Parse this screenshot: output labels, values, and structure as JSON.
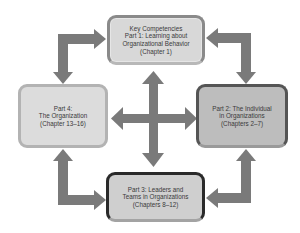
{
  "diagram": {
    "title": "",
    "colors": {
      "arrow": "#7a7a7a",
      "background": "#ffffff"
    },
    "nodes": [
      {
        "id": "top",
        "label": "Key Competencies\nPart 1: Learning about\nOrganizational Behavior\n(Chapter 1)"
      },
      {
        "id": "right",
        "label": "Part 2: The Individual\nin Organizations\n(Chapters 2–7)"
      },
      {
        "id": "bottom",
        "label": "Part 3: Leaders and\nTeams in Organizations\n(Chapters 8–12)"
      },
      {
        "id": "left",
        "label": "Part 4:\nThe Organization\n(Chapter 13–16)"
      }
    ],
    "edges": [
      {
        "from": "left",
        "to": "top",
        "type": "elbow-one-way"
      },
      {
        "from": "top",
        "to": "left",
        "type": "elbow-arrowhead"
      },
      {
        "from": "right",
        "to": "top",
        "type": "elbow-arrowhead"
      },
      {
        "from": "top",
        "to": "right",
        "type": "elbow-arrowhead"
      },
      {
        "from": "left",
        "to": "bottom",
        "type": "elbow-arrowhead"
      },
      {
        "from": "bottom",
        "to": "left",
        "type": "elbow-arrowhead"
      },
      {
        "from": "right",
        "to": "bottom",
        "type": "elbow-arrowhead"
      },
      {
        "from": "bottom",
        "to": "right",
        "type": "elbow-arrowhead"
      },
      {
        "center": "four-way-cross",
        "connects": [
          "top",
          "right",
          "bottom",
          "left"
        ]
      }
    ]
  }
}
